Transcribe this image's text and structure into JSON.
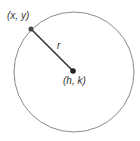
{
  "diagram": {
    "type": "circle",
    "center": {
      "label": "(h, k)"
    },
    "point": {
      "label": "(x, y)"
    },
    "radius": {
      "label": "r"
    },
    "colors": {
      "stroke": "#8a8a8a",
      "segment": "#333333",
      "dot": "#222222"
    }
  }
}
